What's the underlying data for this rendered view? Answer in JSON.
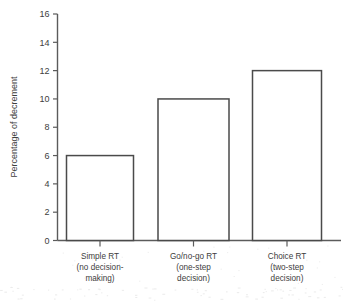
{
  "chart_data": {
    "type": "bar",
    "title": "",
    "subtitle": "",
    "xlabel": "",
    "ylabel": "Percentage of decrement",
    "ylim": [
      0,
      16
    ],
    "ytick_step": 2,
    "yticks": [
      "0",
      "2",
      "4",
      "6",
      "8",
      "10",
      "12",
      "14",
      "16"
    ],
    "grid": false,
    "legend": false,
    "legend_position": "none",
    "categories": [
      "Simple RT (no decision-making)",
      "Go/no-go RT (one-step decision)",
      "Choice RT (two-step decision)"
    ],
    "category_lines": [
      [
        "Simple RT",
        "(no decision-",
        "making)"
      ],
      [
        "Go/no-go RT",
        "(one-step",
        "decision)"
      ],
      [
        "Choice RT",
        "(two-step",
        "decision)"
      ]
    ],
    "values": [
      6,
      10,
      12
    ],
    "bar_style": "outlined",
    "bar_fill": "#ffffff",
    "bar_stroke": "#4a4a4a",
    "axis_color": "#5b5b5b",
    "text_color": "#3d3d3d",
    "background": "#ffffff"
  }
}
